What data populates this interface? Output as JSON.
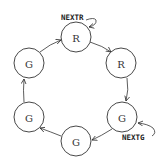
{
  "diagram": {
    "type": "state-cycle",
    "nodes": [
      {
        "id": "n1",
        "label": "R",
        "cx": 76,
        "cy": 37
      },
      {
        "id": "n2",
        "label": "R",
        "cx": 121,
        "cy": 63
      },
      {
        "id": "n3",
        "label": "G",
        "cx": 122,
        "cy": 117
      },
      {
        "id": "n4",
        "label": "G",
        "cx": 76,
        "cy": 141
      },
      {
        "id": "n5",
        "label": "G",
        "cx": 29,
        "cy": 117
      },
      {
        "id": "n6",
        "label": "G",
        "cx": 29,
        "cy": 63
      }
    ],
    "edges": [
      {
        "from": "n1",
        "to": "n2"
      },
      {
        "from": "n2",
        "to": "n3"
      },
      {
        "from": "n3",
        "to": "n4"
      },
      {
        "from": "n4",
        "to": "n5"
      },
      {
        "from": "n5",
        "to": "n6"
      },
      {
        "from": "n6",
        "to": "n1"
      }
    ],
    "annotations": [
      {
        "label": "NEXTR",
        "target": "n1"
      },
      {
        "label": "NEXTG",
        "target": "n3"
      }
    ],
    "colors": {
      "stroke": "#333333",
      "background": "#ffffff"
    }
  }
}
